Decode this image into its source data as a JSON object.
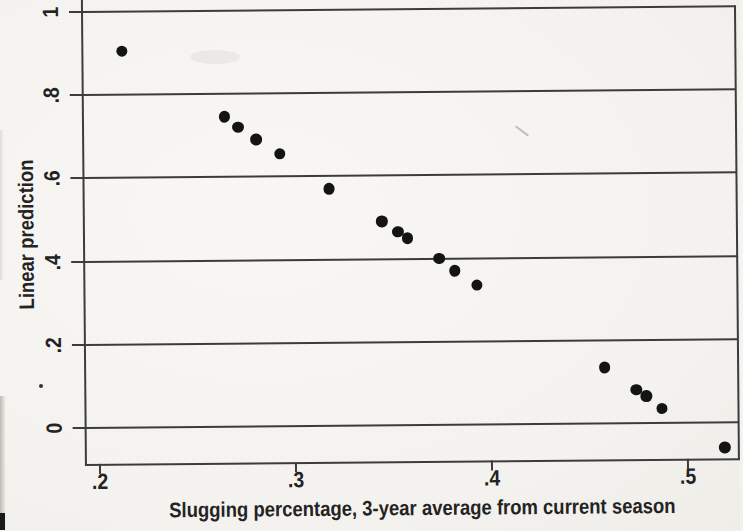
{
  "figure": {
    "kind": "scanned statistical scatter plot"
  },
  "colors": {
    "paper": "#f5f3ef",
    "line": "#3c3c3c",
    "marker": "#141414",
    "text": "#232323"
  },
  "chart_data": {
    "type": "scatter",
    "title": "",
    "xlabel": "Slugging percentage, 3-year average from current season",
    "ylabel": "Linear prediction",
    "xlim": [
      0.193,
      0.526
    ],
    "ylim": [
      -0.087,
      1.029
    ],
    "xticks": [
      0.2,
      0.3,
      0.4,
      0.5
    ],
    "xtick_labels": [
      ".2",
      ".3",
      ".4",
      ".5"
    ],
    "yticks": [
      0,
      0.2,
      0.4,
      0.6,
      0.8,
      1
    ],
    "ytick_labels": [
      "0",
      ".2",
      ".4",
      ".6",
      ".8",
      "1"
    ],
    "grid": "horizontal gridlines at y ticks",
    "legend": "none",
    "marker": "filled black circle",
    "points": [
      [
        0.213,
        0.905
      ],
      [
        0.265,
        0.745
      ],
      [
        0.272,
        0.72
      ],
      [
        0.281,
        0.69
      ],
      [
        0.293,
        0.655
      ],
      [
        0.318,
        0.57
      ],
      [
        0.345,
        0.49
      ],
      [
        0.353,
        0.465
      ],
      [
        0.358,
        0.45
      ],
      [
        0.374,
        0.4
      ],
      [
        0.382,
        0.37
      ],
      [
        0.393,
        0.335
      ],
      [
        0.458,
        0.135
      ],
      [
        0.474,
        0.08
      ],
      [
        0.479,
        0.065
      ],
      [
        0.487,
        0.035
      ],
      [
        0.519,
        -0.06
      ]
    ]
  }
}
